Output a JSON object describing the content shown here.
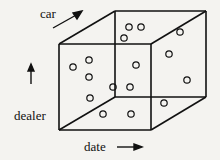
{
  "axes": {
    "car": {
      "label": "car",
      "x": 40,
      "y": 8
    },
    "dealer": {
      "label": "dealer",
      "x": 14,
      "y": 110
    },
    "date": {
      "label": "date",
      "x": 84,
      "y": 141
    }
  },
  "cube": {
    "front": {
      "x1": 59,
      "y1": 44,
      "x2": 151,
      "y2": 130
    },
    "back": {
      "x1": 115,
      "y1": 11,
      "x2": 206,
      "y2": 97
    },
    "stroke": "#111111"
  },
  "points": [
    [
      73,
      67
    ],
    [
      89,
      60
    ],
    [
      89,
      77
    ],
    [
      90,
      98
    ],
    [
      113,
      87
    ],
    [
      103,
      114
    ],
    [
      129,
      27
    ],
    [
      141,
      27
    ],
    [
      124,
      38
    ],
    [
      180,
      32
    ],
    [
      169,
      54
    ],
    [
      136,
      65
    ],
    [
      187,
      80
    ],
    [
      130,
      87
    ],
    [
      164,
      103
    ],
    [
      131,
      114
    ]
  ]
}
